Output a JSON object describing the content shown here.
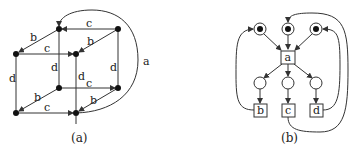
{
  "figure": {
    "panel_a": {
      "caption": "(a)",
      "edge_labels": {
        "top_back_c": "c",
        "top_left_b": "b",
        "top_front_c": "c",
        "top_right_b": "b",
        "left_front_d": "d",
        "back_left_d": "d",
        "front_right_d": "d",
        "back_right_d": "d",
        "bottom_back_c": "c",
        "bottom_left_b": "b",
        "bottom_front_c": "c",
        "bottom_right_b": "b",
        "loop_a": "a"
      }
    },
    "panel_b": {
      "caption": "(b)",
      "transitions": {
        "a": "a",
        "b": "b",
        "c": "c",
        "d": "d"
      },
      "marked_places": 3,
      "empty_places": 3
    }
  }
}
